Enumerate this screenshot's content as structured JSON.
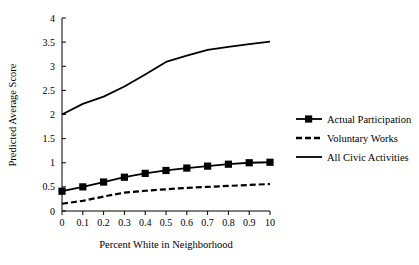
{
  "chart_data": {
    "type": "line",
    "title": "",
    "xlabel": "Percent White in Neighborhood",
    "ylabel": "Predicted Average Score",
    "x": [
      0,
      0.1,
      0.2,
      0.3,
      0.4,
      0.5,
      0.6,
      0.7,
      0.8,
      0.9,
      1.0
    ],
    "xtick_labels": [
      "0",
      "0.1",
      "0.2",
      "0.3",
      "0.4",
      "0.5",
      "0.6",
      "0.7",
      "0.8",
      "0.9",
      "10"
    ],
    "ytick_labels": [
      "0",
      "0.5",
      "1",
      "1.5",
      "2",
      "2.5",
      "3",
      "3.5",
      "4"
    ],
    "ytick_values": [
      0,
      0.5,
      1,
      1.5,
      2,
      2.5,
      3,
      3.5,
      4
    ],
    "xlim": [
      0,
      1.0
    ],
    "ylim": [
      0,
      4
    ],
    "grid": false,
    "legend_position": "right",
    "series": [
      {
        "name": "Actual Participation",
        "style": "solid-with-square-markers",
        "marker": "square",
        "color": "#000000",
        "values": [
          0.41,
          0.5,
          0.6,
          0.7,
          0.78,
          0.84,
          0.89,
          0.93,
          0.97,
          1.0,
          1.01
        ]
      },
      {
        "name": "Voluntary Works",
        "style": "dashed",
        "marker": "none",
        "color": "#000000",
        "values": [
          0.15,
          0.21,
          0.3,
          0.38,
          0.42,
          0.45,
          0.48,
          0.5,
          0.52,
          0.54,
          0.56
        ]
      },
      {
        "name": "All Civic Activities",
        "style": "solid",
        "marker": "none",
        "color": "#000000",
        "values": [
          2.0,
          2.22,
          2.37,
          2.58,
          2.83,
          3.09,
          3.22,
          3.34,
          3.4,
          3.46,
          3.51
        ]
      }
    ]
  },
  "legend": {
    "items": [
      {
        "label": "Actual Participation",
        "key": "actual-participation"
      },
      {
        "label": "Voluntary Works",
        "key": "voluntary-works"
      },
      {
        "label": "All Civic Activities",
        "key": "all-civic-activities"
      }
    ]
  },
  "axes": {
    "x_title": "Percent White in Neighborhood",
    "y_title": "Predicted Average Score"
  }
}
